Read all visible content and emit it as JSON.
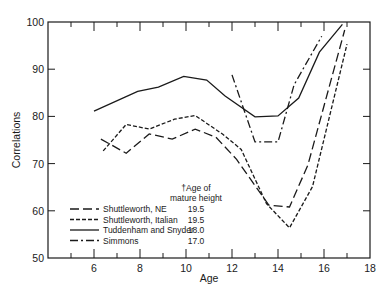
{
  "chart_data": {
    "type": "line",
    "title": "",
    "xlabel": "Age",
    "ylabel": "Correlations",
    "xlim": [
      4,
      18
    ],
    "ylim": [
      50,
      100
    ],
    "x_ticks": [
      6,
      8,
      10,
      12,
      14,
      16,
      18
    ],
    "y_ticks": [
      50,
      60,
      70,
      80,
      90,
      100
    ],
    "grid": false,
    "legend_header": [
      "†Age of",
      "mature height"
    ],
    "legend_position": "lower-left",
    "series": [
      {
        "name": "Shuttleworth, NE",
        "mature_height_age": "19.5",
        "style": "long-dash",
        "x": [
          6.3,
          7.4,
          8.4,
          9.4,
          10.4,
          11.3,
          12.2,
          13.6,
          14.5,
          15.3,
          16.9
        ],
        "y": [
          75.2,
          72.2,
          76.3,
          75.2,
          77.3,
          75.6,
          70.9,
          61.2,
          60.8,
          69.7,
          98.3
        ]
      },
      {
        "name": "Shuttleworth, Italian",
        "mature_height_age": "19.5",
        "style": "short-dash",
        "x": [
          6.4,
          7.4,
          8.4,
          9.5,
          10.4,
          11.6,
          12.4,
          13.5,
          14.5,
          15.5,
          17.0
        ],
        "y": [
          72.7,
          78.3,
          77.3,
          79.4,
          80.2,
          76.2,
          73.0,
          61.5,
          56.4,
          65.1,
          95.3
        ]
      },
      {
        "name": "Tuddenham and Snyder",
        "mature_height_age": "18.0",
        "style": "solid",
        "x": [
          6.0,
          7.9,
          8.8,
          9.9,
          10.9,
          11.7,
          13.0,
          14.0,
          14.9,
          15.8,
          16.8
        ],
        "y": [
          81.1,
          85.3,
          86.2,
          88.5,
          87.7,
          84.3,
          79.9,
          80.1,
          83.9,
          93.6,
          99.5
        ]
      },
      {
        "name": "Simmons",
        "mature_height_age": "17.0",
        "style": "dash-dot",
        "x": [
          12.0,
          13.0,
          14.0,
          14.7,
          15.9
        ],
        "y": [
          88.8,
          74.6,
          74.6,
          86.7,
          97.0
        ]
      }
    ]
  }
}
